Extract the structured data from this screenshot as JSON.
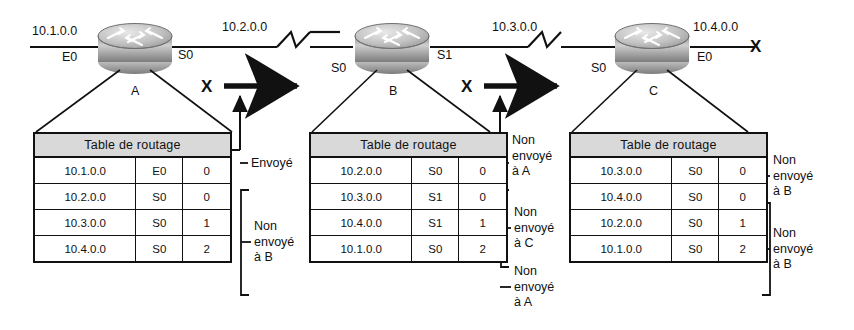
{
  "diagram": {
    "table_header": "Table de routage",
    "routers": [
      {
        "name": "A",
        "left_network": "10.1.0.0",
        "left_interface": "E0",
        "right_network": "10.2.0.0",
        "right_interface": "S0",
        "table": [
          {
            "network": "10.1.0.0",
            "interface": "E0",
            "metric": "0"
          },
          {
            "network": "10.2.0.0",
            "interface": "S0",
            "metric": "0"
          },
          {
            "network": "10.3.0.0",
            "interface": "S0",
            "metric": "1"
          },
          {
            "network": "10.4.0.0",
            "interface": "S0",
            "metric": "2"
          }
        ],
        "annotations": [
          {
            "text": "Envoyé",
            "rows": "1"
          },
          {
            "text": "Non\nenvoyé\nà B",
            "rows": "2-4"
          }
        ]
      },
      {
        "name": "B",
        "left_interface": "S0",
        "right_network": "10.3.0.0",
        "right_interface": "S1",
        "table": [
          {
            "network": "10.2.0.0",
            "interface": "S0",
            "metric": "0"
          },
          {
            "network": "10.3.0.0",
            "interface": "S1",
            "metric": "0"
          },
          {
            "network": "10.4.0.0",
            "interface": "S1",
            "metric": "1"
          },
          {
            "network": "10.1.0.0",
            "interface": "S0",
            "metric": "2"
          }
        ],
        "annotations": [
          {
            "text": "Non\nenvoyé\nà A",
            "rows": "1"
          },
          {
            "text": "Non\nenvoyé\nà C",
            "rows": "2-3"
          },
          {
            "text": "Non\nenvoyé\nà A",
            "rows": "4"
          }
        ]
      },
      {
        "name": "C",
        "left_interface": "S0",
        "right_network": "10.4.0.0",
        "right_interface": "E0",
        "table": [
          {
            "network": "10.3.0.0",
            "interface": "S0",
            "metric": "0"
          },
          {
            "network": "10.4.0.0",
            "interface": "S0",
            "metric": "0"
          },
          {
            "network": "10.2.0.0",
            "interface": "S0",
            "metric": "1"
          },
          {
            "network": "10.1.0.0",
            "interface": "S0",
            "metric": "2"
          }
        ],
        "annotations": [
          {
            "text": "Non\nenvoyé\nà B",
            "rows": "1"
          },
          {
            "text": "Non\nenvoyé\nà B",
            "rows": "2-4"
          }
        ]
      }
    ],
    "update_arrows": [
      {
        "from": "A",
        "to": "B",
        "blocked_marker": "X"
      },
      {
        "from": "B",
        "to": "C",
        "blocked_marker": "X"
      }
    ],
    "failed_link_marker": "X",
    "colors": {
      "line": "#111111",
      "header_fill": "#d9d9d9",
      "router_body": "#b5b5b5",
      "background": "#ffffff"
    }
  }
}
